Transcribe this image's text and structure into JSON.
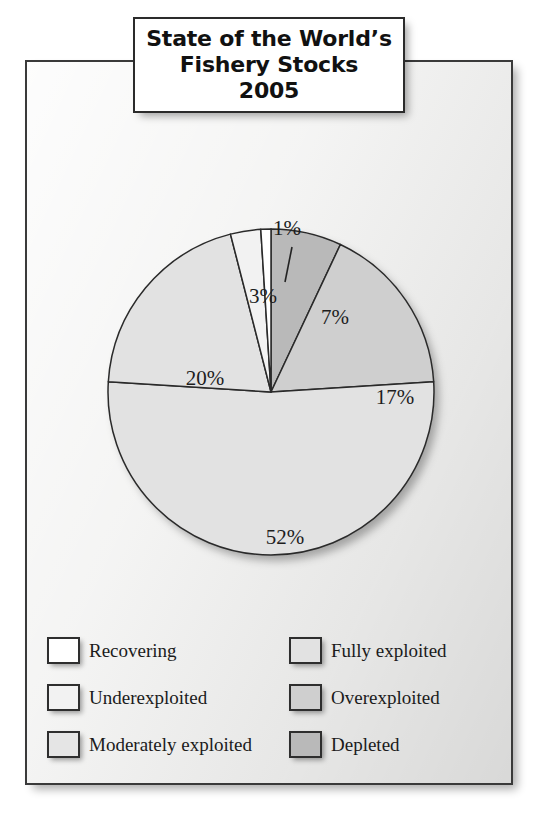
{
  "figure": {
    "title_lines": [
      "State of the World’s",
      "Fishery Stocks",
      "2005"
    ],
    "background_color": "#f1f1f0",
    "frame_color": "#3a3a3a"
  },
  "chart_data": {
    "type": "pie",
    "unit": "%",
    "start_angle_deg": 0,
    "direction": "clockwise",
    "legend_position": "bottom",
    "grid": false,
    "categories": [
      "Depleted",
      "Overexploited",
      "Fully exploited",
      "Moderately exploited",
      "Underexploited",
      "Recovering"
    ],
    "values": [
      7,
      17,
      52,
      20,
      3,
      1
    ],
    "labels": [
      "7%",
      "17%",
      "52%",
      "20%",
      "3%",
      "1%"
    ],
    "colors": [
      "#b9b9b9",
      "#cfcfcf",
      "#e2e2e2",
      "#e2e2e2",
      "#f2f2f2",
      "#ffffff"
    ],
    "slices": [
      {
        "name": "Depleted",
        "value": 7,
        "label": "7%",
        "color": "#b9b9b9",
        "label_x": 308,
        "label_y": 257
      },
      {
        "name": "Overexploited",
        "value": 17,
        "label": "17%",
        "color": "#cfcfcf",
        "label_x": 368,
        "label_y": 337
      },
      {
        "name": "Fully exploited",
        "value": 52,
        "label": "52%",
        "color": "#e2e2e2",
        "label_x": 258,
        "label_y": 477
      },
      {
        "name": "Moderately exploited",
        "value": 20,
        "label": "20%",
        "color": "#e2e2e2",
        "label_x": 178,
        "label_y": 318
      },
      {
        "name": "Underexploited",
        "value": 3,
        "label": "3%",
        "color": "#f2f2f2",
        "label_x": 236,
        "label_y": 236
      },
      {
        "name": "Recovering",
        "value": 1,
        "label": "1%",
        "color": "#ffffff",
        "label_x": 260,
        "label_y": 168
      }
    ]
  },
  "legend": {
    "items": [
      {
        "label": "Recovering",
        "color": "#ffffff"
      },
      {
        "label": "Fully exploited",
        "color": "#e2e2e2"
      },
      {
        "label": "Underexploited",
        "color": "#f2f2f2"
      },
      {
        "label": "Overexploited",
        "color": "#cfcfcf"
      },
      {
        "label": "Moderately exploited",
        "color": "#e5e5e5"
      },
      {
        "label": "Depleted",
        "color": "#b9b9b9"
      }
    ]
  }
}
